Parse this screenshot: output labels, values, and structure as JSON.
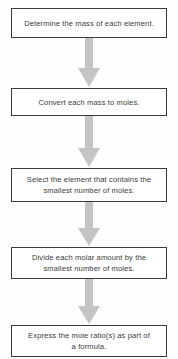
{
  "diagram": {
    "orientation": "vertical-top-to-bottom",
    "box_border_color": "#3a3a3a",
    "box_fill_color": "#ffffff",
    "arrow_color": "#c4c4c4",
    "text_color": "#3c3c3c",
    "background_color": "#fdfdfd",
    "steps": [
      {
        "id": "step-1",
        "text": "Determine the mass of each element."
      },
      {
        "id": "step-2",
        "text": "Convert each mass to moles."
      },
      {
        "id": "step-3",
        "text": "Select the element that contains the\nsmallest number of moles."
      },
      {
        "id": "step-4",
        "text": "Divide each molar amount by the\nsmallest number of moles."
      },
      {
        "id": "step-5",
        "text": "Express the mole ratio(s) as part of\na formula."
      }
    ],
    "connectors": [
      {
        "id": "arrow-1",
        "from": "step-1",
        "to": "step-2",
        "shape": "down-block-arrow"
      },
      {
        "id": "arrow-2",
        "from": "step-2",
        "to": "step-3",
        "shape": "down-block-arrow"
      },
      {
        "id": "arrow-3",
        "from": "step-3",
        "to": "step-4",
        "shape": "down-block-arrow"
      },
      {
        "id": "arrow-4",
        "from": "step-4",
        "to": "step-5",
        "shape": "down-block-arrow"
      }
    ]
  }
}
